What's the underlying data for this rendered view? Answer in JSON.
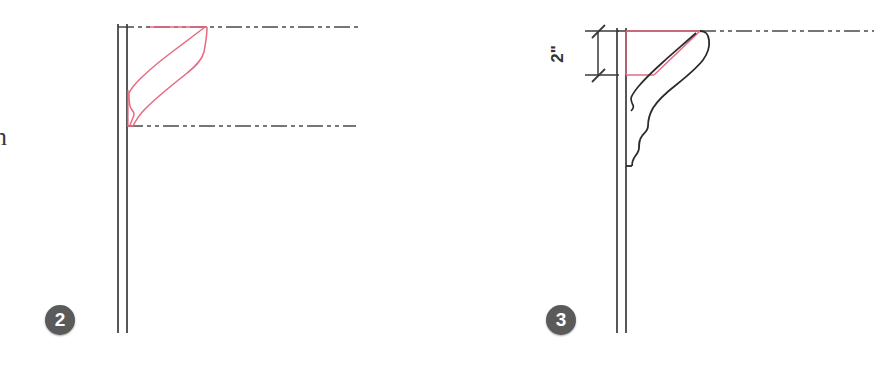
{
  "sheet": {
    "background_color": "#ffffff",
    "line_color": "#3a3a3a",
    "accent_color": "#e8687f",
    "bubble_color": "#5a5a5a",
    "width": 891,
    "height": 368
  },
  "margin_note": {
    "text": "n"
  },
  "details": [
    {
      "id": "detail-2",
      "bubble_label": "2",
      "title": "Crown molding detail 2",
      "wall": {
        "line_1_x": 118,
        "line_2_x": 127,
        "top_y": 24,
        "bottom_y": 333
      },
      "ceiling_line": {
        "style": "dash-dot-dot",
        "y": 27,
        "x_start": 118,
        "x_end": 360
      },
      "lower_reference_line": {
        "style": "dash-dot-dot",
        "y": 126,
        "x_start": 127,
        "x_end": 355
      },
      "profile": {
        "stroke": "#e8687f",
        "description": "red crown molding section outline"
      }
    },
    {
      "id": "detail-3",
      "bubble_label": "3",
      "title": "Crown molding detail 3",
      "wall": {
        "line_1_x": 617,
        "line_2_x": 626,
        "top_y": 28,
        "bottom_y": 333
      },
      "ceiling_line": {
        "style": "dash-dot-dot",
        "y": 31,
        "x_start": 617,
        "x_end": 872
      },
      "dimension": {
        "label": "2\"",
        "value": 2,
        "unit": "inch",
        "orientation": "vertical",
        "tick_style": "architectural-slash",
        "x": 598,
        "y_top": 31,
        "y_bottom": 75
      },
      "profile_black": {
        "stroke": "#2b2b2b",
        "description": "existing black ogee crown molding profile"
      },
      "profile_red": {
        "stroke": "#e8687f",
        "description": "red trapezoid overlay of new molding bounds"
      }
    }
  ]
}
